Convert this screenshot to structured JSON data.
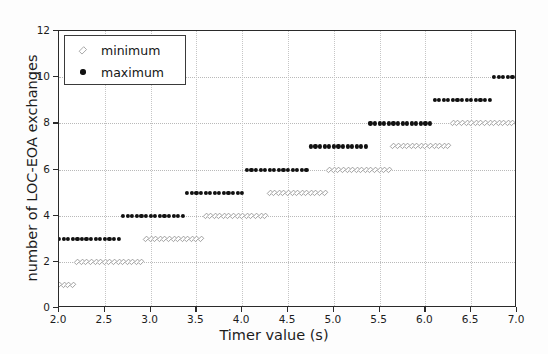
{
  "chart_data": {
    "type": "scatter",
    "title": "",
    "xlabel": "Timer value (s)",
    "ylabel": "number of LOC-EOA exchanges",
    "xlim": [
      2.0,
      7.0
    ],
    "ylim": [
      0,
      12
    ],
    "xticks": [
      "2.0",
      "2.5",
      "3.0",
      "3.5",
      "4.0",
      "4.5",
      "5.0",
      "5.5",
      "6.0",
      "6.5",
      "7.0"
    ],
    "xtick_values": [
      2.0,
      2.5,
      3.0,
      3.5,
      4.0,
      4.5,
      5.0,
      5.5,
      6.0,
      6.5,
      7.0
    ],
    "yticks": [
      "0",
      "2",
      "4",
      "6",
      "8",
      "10",
      "12"
    ],
    "ytick_values": [
      0,
      2,
      4,
      6,
      8,
      10,
      12
    ],
    "grid": true,
    "legend_position": "upper left",
    "legend": [
      "minimum",
      "maximum"
    ],
    "series": [
      {
        "name": "minimum",
        "marker": "diamond-open",
        "color": "#8d8d8d",
        "steps": [
          {
            "y": 1,
            "x_start": 2.0,
            "x_end": 2.15
          },
          {
            "y": 2,
            "x_start": 2.2,
            "x_end": 2.9
          },
          {
            "y": 3,
            "x_start": 2.95,
            "x_end": 3.55
          },
          {
            "y": 4,
            "x_start": 3.6,
            "x_end": 4.25
          },
          {
            "y": 5,
            "x_start": 4.3,
            "x_end": 4.9
          },
          {
            "y": 6,
            "x_start": 4.95,
            "x_end": 5.6
          },
          {
            "y": 7,
            "x_start": 5.65,
            "x_end": 6.25
          },
          {
            "y": 8,
            "x_start": 6.3,
            "x_end": 7.0
          }
        ]
      },
      {
        "name": "maximum",
        "marker": "circle-filled",
        "color": "#111111",
        "steps": [
          {
            "y": 3,
            "x_start": 2.0,
            "x_end": 2.65
          },
          {
            "y": 4,
            "x_start": 2.7,
            "x_end": 3.35
          },
          {
            "y": 5,
            "x_start": 3.4,
            "x_end": 4.0
          },
          {
            "y": 6,
            "x_start": 4.05,
            "x_end": 4.7
          },
          {
            "y": 7,
            "x_start": 4.75,
            "x_end": 5.35
          },
          {
            "y": 8,
            "x_start": 5.4,
            "x_end": 6.05
          },
          {
            "y": 9,
            "x_start": 6.1,
            "x_end": 6.7
          },
          {
            "y": 10,
            "x_start": 6.75,
            "x_end": 7.0
          }
        ]
      }
    ],
    "point_step": 0.05
  },
  "legend": {
    "minimum_label": "minimum",
    "maximum_label": "maximum"
  },
  "axes": {
    "x_title": "Timer value (s)",
    "y_title": "number of LOC-EOA exchanges"
  }
}
